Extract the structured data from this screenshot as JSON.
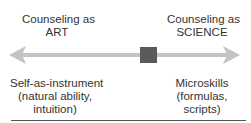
{
  "diagram": {
    "left_pole": {
      "title_line1": "Counseling as",
      "title_line2": "ART",
      "desc_line1": "Self-as-instrument",
      "desc_line2": "(natural ability,",
      "desc_line3": "intuition)"
    },
    "right_pole": {
      "title_line1": "Counseling as",
      "title_line2": "SCIENCE",
      "desc_line1": "Microskills",
      "desc_line2": "(formulas,",
      "desc_line3": "scripts)"
    },
    "colors": {
      "arrow": "#c4c4c4",
      "marker": "#5a5a5a",
      "text": "#333333",
      "rule": "#555555"
    },
    "marker_position_pct": 62
  }
}
